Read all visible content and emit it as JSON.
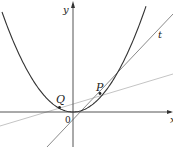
{
  "figure": {
    "type": "diagram",
    "labels": {
      "y_axis": "y",
      "x_axis": "x",
      "origin": "0",
      "point_p": "P",
      "point_q": "Q",
      "tangent": "t"
    },
    "colors": {
      "curve": "#333333",
      "axes": "#555555",
      "tangent": "#8a8a8a",
      "secant": "#c4c4c4",
      "points": "#222222"
    }
  }
}
